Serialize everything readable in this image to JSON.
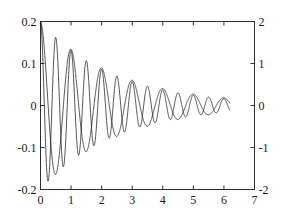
{
  "chart_data": {
    "type": "line",
    "title": "",
    "xlabel": "",
    "ylabel": "",
    "xlim": [
      0,
      7
    ],
    "ylim_left": [
      -0.2,
      0.2
    ],
    "ylim_right": [
      -2,
      2
    ],
    "grid": false,
    "legend": "none",
    "axis_box": true,
    "tick_direction": "in",
    "line_color": "#1a1a1a",
    "background_color": "#ffffff",
    "xticks": [
      "0",
      "1",
      "2",
      "3",
      "4",
      "5",
      "6",
      "7"
    ],
    "xtick_values": [
      0,
      1,
      2,
      3,
      4,
      5,
      6,
      7
    ],
    "yticks_left": [
      "0.2",
      "0.1",
      "0",
      "-0.1",
      "-0.2"
    ],
    "ytick_values_left": [
      0.2,
      0.1,
      0,
      -0.1,
      -0.2
    ],
    "yticks_right": [
      "2",
      "1",
      "0",
      "-1",
      "-2"
    ],
    "ytick_values_right": [
      2,
      1,
      0,
      -1,
      -2
    ],
    "series": [
      {
        "name": "fast-damped-oscillation",
        "axis": "left",
        "model": "damped_cosine",
        "amplitude": 0.2,
        "decay": 0.42,
        "angular_frequency": 12.566,
        "phase": 0,
        "x_start": 0,
        "x_end": 6.2,
        "description": "High frequency damped cosine starting at 0.2, period about 0.5, decaying toward 0 by x=6.2"
      },
      {
        "name": "slow-damped-oscillation",
        "axis": "left",
        "model": "damped_cosine",
        "amplitude": 0.2,
        "decay": 0.4,
        "angular_frequency": 6.283,
        "phase": 0,
        "x_start": 0,
        "x_end": 6.2,
        "description": "Lower frequency damped cosine starting at 0.2, period about 1.0, decaying toward 0 by x=6.2"
      }
    ]
  }
}
